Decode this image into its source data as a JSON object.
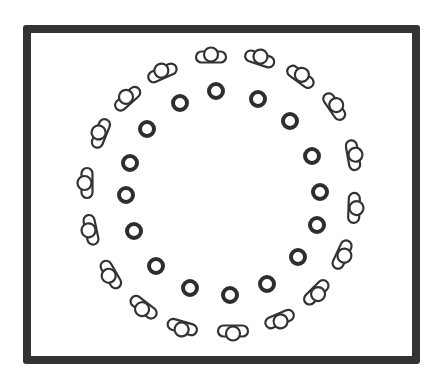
{
  "diagram": {
    "frame": {
      "x": 23,
      "y": 25,
      "width": 397,
      "height": 339,
      "stroke": "#333333",
      "stroke_width": 8
    },
    "colors": {
      "stroke": "#333333",
      "fill": "#ffffff",
      "ion_stroke": "#2e2e2e"
    },
    "ring_center": {
      "x": 222,
      "y": 196
    },
    "inner_ions": {
      "shape": "thick-ring",
      "radius": 7,
      "stroke_width": 4,
      "count": 16,
      "positions": [
        [
          216,
          91
        ],
        [
          258,
          99
        ],
        [
          290,
          121
        ],
        [
          312,
          156
        ],
        [
          320,
          192
        ],
        [
          317,
          225
        ],
        [
          298,
          257
        ],
        [
          267,
          284
        ],
        [
          230,
          295
        ],
        [
          190,
          288
        ],
        [
          156,
          266
        ],
        [
          134,
          231
        ],
        [
          126,
          195
        ],
        [
          130,
          163
        ],
        [
          147,
          129
        ],
        [
          180,
          103
        ]
      ]
    },
    "outer_molecules": {
      "shape": "capsule-with-center-circle",
      "capsule_length": 30,
      "capsule_width": 11,
      "circle_radius": 7,
      "count": 18,
      "items": [
        {
          "x": 211,
          "y": 56,
          "angle": 0
        },
        {
          "x": 260,
          "y": 58,
          "angle": 18
        },
        {
          "x": 301,
          "y": 76,
          "angle": 36
        },
        {
          "x": 335,
          "y": 106,
          "angle": 55
        },
        {
          "x": 354,
          "y": 155,
          "angle": 80
        },
        {
          "x": 355,
          "y": 208,
          "angle": 92
        },
        {
          "x": 343,
          "y": 255,
          "angle": 115
        },
        {
          "x": 317,
          "y": 293,
          "angle": 135
        },
        {
          "x": 280,
          "y": 320,
          "angle": 157
        },
        {
          "x": 233,
          "y": 332,
          "angle": 180
        },
        {
          "x": 182,
          "y": 328,
          "angle": 196
        },
        {
          "x": 143,
          "y": 308,
          "angle": 218
        },
        {
          "x": 110,
          "y": 275,
          "angle": 240
        },
        {
          "x": 90,
          "y": 230,
          "angle": 258
        },
        {
          "x": 86,
          "y": 183,
          "angle": 270
        },
        {
          "x": 100,
          "y": 133,
          "angle": 292
        },
        {
          "x": 127,
          "y": 98,
          "angle": 318
        },
        {
          "x": 162,
          "y": 72,
          "angle": 336
        }
      ]
    }
  }
}
